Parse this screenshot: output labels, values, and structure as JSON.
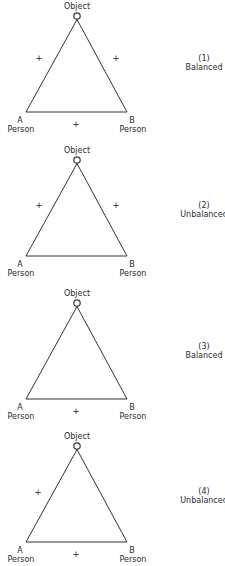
{
  "diagram": {
    "vertex_labels": {
      "top": "Object",
      "left_letter": "A",
      "left_role": "Person",
      "right_letter": "B",
      "right_role": "Person"
    },
    "line_color": "#333333",
    "panels": [
      {
        "number": "(1)",
        "status": "Balanced",
        "signs": {
          "left": "+",
          "right": "+",
          "bottom": "+"
        }
      },
      {
        "number": "(2)",
        "status": "Unbalanced",
        "signs": {
          "left": "+",
          "right": "+",
          "bottom": ""
        }
      },
      {
        "number": "(3)",
        "status": "Balanced",
        "signs": {
          "left": "",
          "right": "",
          "bottom": "+"
        }
      },
      {
        "number": "(4)",
        "status": "Unbalanced",
        "signs": {
          "left": "+",
          "right": "",
          "bottom": "+"
        }
      }
    ]
  }
}
